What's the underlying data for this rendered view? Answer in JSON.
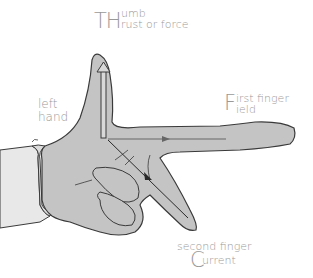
{
  "diagram": {
    "hand_label": {
      "line1": "left",
      "line2": "hand"
    },
    "thumb": {
      "initial": "TH",
      "line1": "umb",
      "line2": "rust or force"
    },
    "first_finger": {
      "initial": "F",
      "line1": "irst finger",
      "line2": "ield"
    },
    "second_finger": {
      "line1": "second finger",
      "initial": "C",
      "line2": "urrent"
    },
    "colors": {
      "skin": "#c4c4c4",
      "sleeve": "#e8e8e8",
      "outline": "#3a3a3a",
      "label": "#9a9a9a",
      "arrow": "#555555"
    }
  }
}
